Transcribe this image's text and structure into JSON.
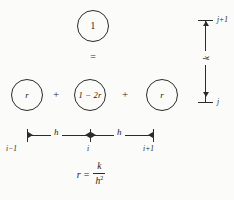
{
  "figure": {
    "kind": "finite-difference-stencil-diagram",
    "colors": {
      "ink": "#2b2b2b",
      "background": "#fbfbf9"
    }
  },
  "stencil": {
    "result_node": {
      "label": "1"
    },
    "relation_symbol": "=",
    "operands": [
      {
        "label": "r"
      },
      {
        "label": "1 − 2r"
      },
      {
        "label": "r"
      }
    ],
    "operators": [
      "+",
      "+"
    ]
  },
  "space_axis": {
    "spacing_labels": [
      "h",
      "h"
    ],
    "tick_labels": [
      "i−1",
      "i",
      "i+1"
    ]
  },
  "time_axis": {
    "spacing_label": "k",
    "top_label": "j+1",
    "bottom_label": "j"
  },
  "formula": {
    "variable": "r",
    "equals": "=",
    "numerator": "k",
    "denominator": "h",
    "denominator_exponent": "2"
  }
}
